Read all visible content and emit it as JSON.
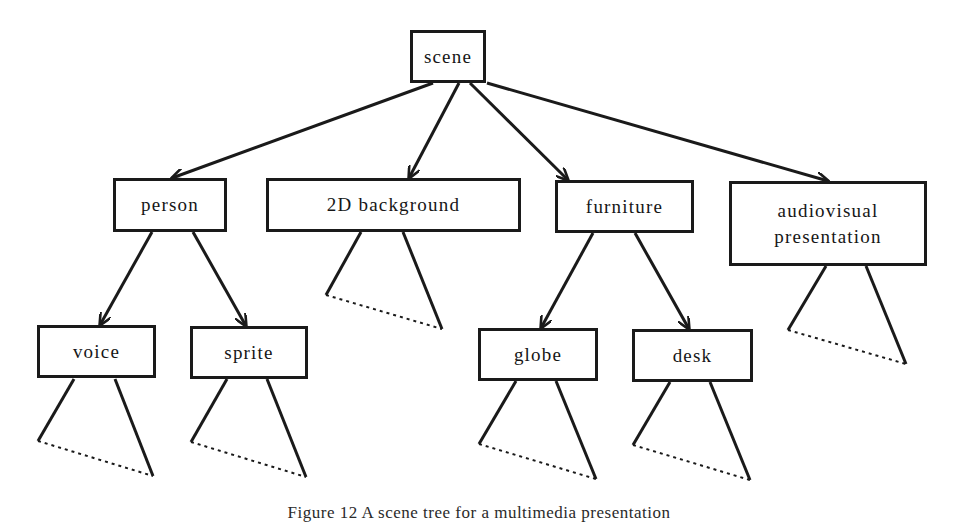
{
  "diagram": {
    "type": "tree",
    "nodes": {
      "scene": {
        "label": "scene",
        "x": 410,
        "y": 30,
        "w": 76,
        "h": 53
      },
      "person": {
        "label": "person",
        "x": 113,
        "y": 178,
        "w": 114,
        "h": 54
      },
      "background": {
        "label": "2D background",
        "x": 266,
        "y": 178,
        "w": 255,
        "h": 54
      },
      "furniture": {
        "label": "furniture",
        "x": 555,
        "y": 180,
        "w": 139,
        "h": 53
      },
      "audiovisual": {
        "label": "audiovisual\npresentation",
        "x": 729,
        "y": 181,
        "w": 198,
        "h": 85
      },
      "voice": {
        "label": "voice",
        "x": 37,
        "y": 325,
        "w": 119,
        "h": 53
      },
      "sprite": {
        "label": "sprite",
        "x": 190,
        "y": 326,
        "w": 118,
        "h": 53
      },
      "globe": {
        "label": "globe",
        "x": 478,
        "y": 328,
        "w": 120,
        "h": 53
      },
      "desk": {
        "label": "desk",
        "x": 632,
        "y": 329,
        "w": 121,
        "h": 53
      }
    },
    "edges": [
      {
        "from": "scene",
        "to": "person",
        "x1": 433,
        "y1": 83,
        "x2": 172,
        "y2": 178
      },
      {
        "from": "scene",
        "to": "background",
        "x1": 459,
        "y1": 83,
        "x2": 409,
        "y2": 178
      },
      {
        "from": "scene",
        "to": "furniture",
        "x1": 470,
        "y1": 83,
        "x2": 568,
        "y2": 180
      },
      {
        "from": "scene",
        "to": "audiovisual",
        "x1": 487,
        "y1": 83,
        "x2": 828,
        "y2": 181
      },
      {
        "from": "person",
        "to": "voice",
        "x1": 152,
        "y1": 232,
        "x2": 100,
        "y2": 325
      },
      {
        "from": "person",
        "to": "sprite",
        "x1": 193,
        "y1": 232,
        "x2": 246,
        "y2": 326
      },
      {
        "from": "furniture",
        "to": "globe",
        "x1": 593,
        "y1": 233,
        "x2": 541,
        "y2": 328
      },
      {
        "from": "furniture",
        "to": "desk",
        "x1": 635,
        "y1": 233,
        "x2": 689,
        "y2": 329
      }
    ],
    "subtrees": [
      {
        "parent": "background",
        "apex_l": [
          361,
          232
        ],
        "apex_r": [
          403,
          232
        ],
        "left": [
          326,
          295
        ],
        "right": [
          442,
          329
        ]
      },
      {
        "parent": "audiovisual",
        "apex_l": [
          826,
          266
        ],
        "apex_r": [
          866,
          266
        ],
        "left": [
          788,
          330
        ],
        "right": [
          906,
          364
        ]
      },
      {
        "parent": "voice",
        "apex_l": [
          74,
          379
        ],
        "apex_r": [
          115,
          379
        ],
        "left": [
          38,
          441
        ],
        "right": [
          153,
          476
        ]
      },
      {
        "parent": "sprite",
        "apex_l": [
          227,
          379
        ],
        "apex_r": [
          267,
          379
        ],
        "left": [
          191,
          442
        ],
        "right": [
          306,
          477
        ]
      },
      {
        "parent": "globe",
        "apex_l": [
          516,
          381
        ],
        "apex_r": [
          556,
          381
        ],
        "left": [
          479,
          444
        ],
        "right": [
          596,
          479
        ]
      },
      {
        "parent": "desk",
        "apex_l": [
          670,
          382
        ],
        "apex_r": [
          710,
          382
        ],
        "left": [
          633,
          445
        ],
        "right": [
          750,
          480
        ]
      }
    ],
    "stroke_color": "#1a1a1a"
  },
  "caption": {
    "text": "Figure 12 A scene tree for a multimedia presentation"
  }
}
